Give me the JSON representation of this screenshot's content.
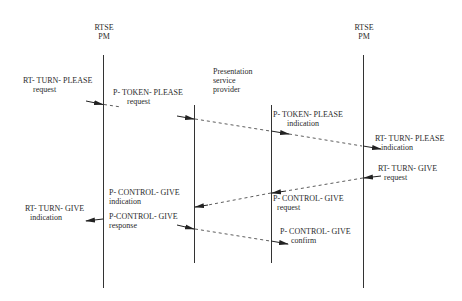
{
  "diagram": {
    "type": "sequence",
    "participants": [
      {
        "id": "left_pm",
        "line1": "RTSE",
        "line2": "PM"
      },
      {
        "id": "provider",
        "line1": "Presentation",
        "line2": "service",
        "line3": "provider"
      },
      {
        "id": "right_pm",
        "line1": "RTSE",
        "line2": "PM"
      }
    ],
    "messages": [
      {
        "name": "RT- TURN- PLEASE",
        "kind": "request"
      },
      {
        "name": "P- TOKEN- PLEASE",
        "kind": "request"
      },
      {
        "name": "P- TOKEN- PLEASE",
        "kind": "indication"
      },
      {
        "name": "RT- TURN- PLEASE",
        "kind": "indication"
      },
      {
        "name": "RT- TURN- GIVE",
        "kind": "request"
      },
      {
        "name": "P- CONTROL- GIVE",
        "kind": "request"
      },
      {
        "name": "P- CONTROL- GIVE",
        "kind": "indication"
      },
      {
        "name": "RT- TURN- GIVE",
        "kind": "indication"
      },
      {
        "name": "P-CONTROL- GIVE",
        "kind": "response"
      },
      {
        "name": "P- CONTROL- GIVE",
        "kind": "confirm"
      }
    ],
    "line_color": "#333333"
  }
}
